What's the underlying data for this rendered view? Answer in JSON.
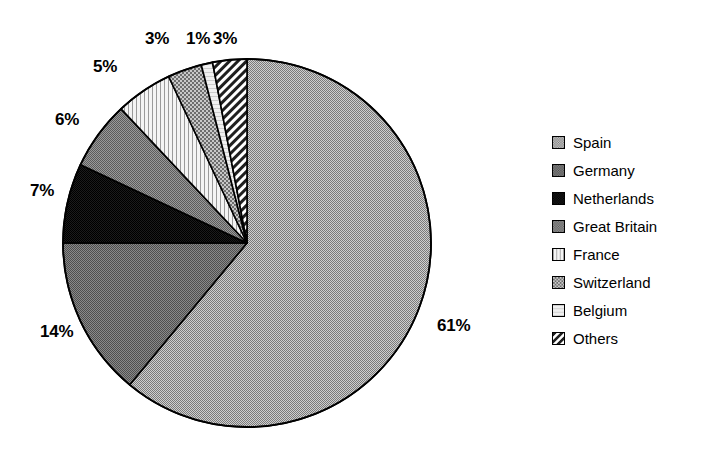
{
  "chart_data": {
    "type": "pie",
    "title": "",
    "subtitle": "",
    "xlabel": "",
    "ylabel": "",
    "legend_position": "right",
    "grid": false,
    "start_angle_deg": 0,
    "direction": "clockwise",
    "categories": [
      "Spain",
      "Germany",
      "Netherlands",
      "Great Britain",
      "France",
      "Switzerland",
      "Belgium",
      "Others"
    ],
    "values": [
      61,
      14,
      7,
      6,
      5,
      3,
      1,
      3
    ],
    "value_labels": [
      "61%",
      "14%",
      "7%",
      "6%",
      "5%",
      "3%",
      "1%",
      "3%"
    ],
    "slices": [
      {
        "label": "Spain",
        "value": 61,
        "value_label": "61%",
        "fill": "gray-50-dither",
        "color": "#a8a8a8"
      },
      {
        "label": "Germany",
        "value": 14,
        "value_label": "14%",
        "fill": "gray-65-dither",
        "color": "#6f6f6f"
      },
      {
        "label": "Netherlands",
        "value": 7,
        "value_label": "7%",
        "fill": "near-black",
        "color": "#1a1a1a"
      },
      {
        "label": "Great Britain",
        "value": 6,
        "value_label": "6%",
        "fill": "gray-60-dither",
        "color": "#7d7d7d"
      },
      {
        "label": "France",
        "value": 5,
        "value_label": "5%",
        "fill": "vertical-dots",
        "color": "#f2f2f2"
      },
      {
        "label": "Switzerland",
        "value": 3,
        "value_label": "3%",
        "fill": "cross-hatch",
        "color": "#707070"
      },
      {
        "label": "Belgium",
        "value": 1,
        "value_label": "1%",
        "fill": "light-plain",
        "color": "#efefef"
      },
      {
        "label": "Others",
        "value": 3,
        "value_label": "3%",
        "fill": "diagonal-hatch",
        "color": "#909090"
      }
    ]
  },
  "legend": {
    "items": [
      {
        "label": "Spain",
        "swatch": "gray-50-dither"
      },
      {
        "label": "Germany",
        "swatch": "gray-65-dither"
      },
      {
        "label": "Netherlands",
        "swatch": "near-black"
      },
      {
        "label": "Great Britain",
        "swatch": "gray-60-dither"
      },
      {
        "label": "France",
        "swatch": "vertical-dots"
      },
      {
        "label": "Switzerland",
        "swatch": "cross-hatch"
      },
      {
        "label": "Belgium",
        "swatch": "light-plain"
      },
      {
        "label": "Others",
        "swatch": "diagonal-hatch"
      }
    ]
  },
  "labels": [
    {
      "text": "61%",
      "x": 437,
      "y": 316
    },
    {
      "text": "14%",
      "x": 40,
      "y": 322
    },
    {
      "text": "7%",
      "x": 30,
      "y": 181
    },
    {
      "text": "6%",
      "x": 55,
      "y": 110
    },
    {
      "text": "5%",
      "x": 93,
      "y": 57
    },
    {
      "text": "3%",
      "x": 145,
      "y": 29
    },
    {
      "text": "1%",
      "x": 186,
      "y": 29
    },
    {
      "text": "3%",
      "x": 213,
      "y": 29
    }
  ],
  "geometry": {
    "center_x": 247,
    "center_y": 243,
    "radius": 184,
    "outline_color": "#000000"
  }
}
